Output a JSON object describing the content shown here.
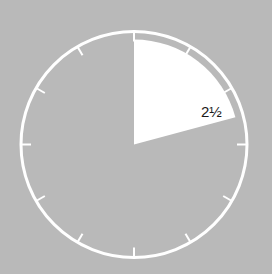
{
  "diagram": {
    "type": "clock-fraction",
    "background_color": "#b9b9b9",
    "stroke_color": "#ffffff",
    "sector_color": "#ffffff",
    "label": "2½",
    "label_text_color": "#1a1a1a",
    "hour_ticks": 12,
    "sector_start_hour": 0,
    "sector_end_hour": 2.5
  }
}
